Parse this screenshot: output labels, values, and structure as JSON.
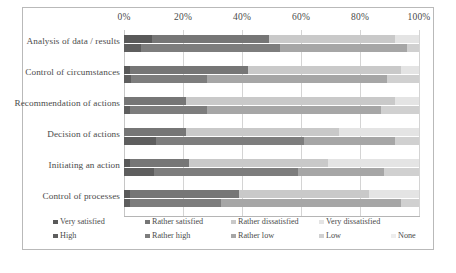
{
  "chart_data": {
    "type": "bar",
    "orientation": "horizontal",
    "stacked": true,
    "title": "",
    "xlabel": "",
    "ylabel": "",
    "xlim": [
      0,
      100
    ],
    "xticks": [
      "0%",
      "20%",
      "40%",
      "60%",
      "80%",
      "100%"
    ],
    "xtick_values": [
      0,
      20,
      40,
      60,
      80,
      100
    ],
    "grid": true,
    "legend_position": "bottom",
    "categories": [
      "Analysis of data / results",
      "Control of circumstances",
      "Recommendation of actions",
      "Decision of actions",
      "Initiating an action",
      "Control of processes"
    ],
    "series_groups": [
      {
        "name": "Satisfaction",
        "series": [
          {
            "name": "Very satisfied",
            "color": "#595959",
            "values": [
              9.5,
              2.0,
              0.0,
              0.0,
              2.0,
              2.0
            ]
          },
          {
            "name": "Rather satisfied",
            "color": "#767676",
            "values": [
              39.5,
              40.0,
              21.0,
              21.0,
              20.0,
              37.0
            ]
          },
          {
            "name": "Rather dissatisfied",
            "color": "#c9c9c9",
            "values": [
              43.0,
              52.0,
              71.0,
              52.0,
              47.0,
              44.0
            ]
          },
          {
            "name": "Very dissatisfied",
            "color": "#e4e4e4",
            "values": [
              8.0,
              6.0,
              8.0,
              27.0,
              31.0,
              17.0
            ]
          }
        ]
      },
      {
        "name": "Influence",
        "series": [
          {
            "name": "High",
            "color": "#5e5e5e",
            "values": [
              5.7,
              2.5,
              2.0,
              11.0,
              10.0,
              2.0
            ]
          },
          {
            "name": "Rather high",
            "color": "#7d7d7d",
            "values": [
              47.3,
              25.5,
              26.0,
              50.0,
              49.0,
              31.0
            ]
          },
          {
            "name": "Rather low",
            "color": "#a6a6a6",
            "values": [
              43.0,
              61.0,
              59.0,
              31.0,
              29.0,
              61.0
            ]
          },
          {
            "name": "Low",
            "color": "#d0d0d0",
            "values": [
              4.0,
              11.0,
              13.0,
              8.0,
              12.0,
              6.0
            ]
          },
          {
            "name": "None",
            "color": "#ededed",
            "values": [
              0.0,
              0.0,
              0.0,
              0.0,
              0.0,
              0.0
            ]
          }
        ]
      }
    ]
  },
  "axis": {
    "ticks": [
      {
        "label": "0%",
        "value": 0
      },
      {
        "label": "20%",
        "value": 20
      },
      {
        "label": "40%",
        "value": 40
      },
      {
        "label": "60%",
        "value": 60
      },
      {
        "label": "80%",
        "value": 80
      },
      {
        "label": "100%",
        "value": 100
      }
    ]
  },
  "legend": {
    "row1": [
      {
        "label": "Very satisfied",
        "color": "#595959"
      },
      {
        "label": "Rather satisfied",
        "color": "#767676"
      },
      {
        "label": "Rather dissatisfied",
        "color": "#c9c9c9"
      },
      {
        "label": "Very dissatisfied",
        "color": "#e4e4e4"
      }
    ],
    "row2": [
      {
        "label": "High",
        "color": "#5e5e5e"
      },
      {
        "label": "Rather high",
        "color": "#7d7d7d"
      },
      {
        "label": "Rather low",
        "color": "#a6a6a6"
      },
      {
        "label": "Low",
        "color": "#d0d0d0"
      },
      {
        "label": "None",
        "color": "#ededed"
      }
    ]
  }
}
